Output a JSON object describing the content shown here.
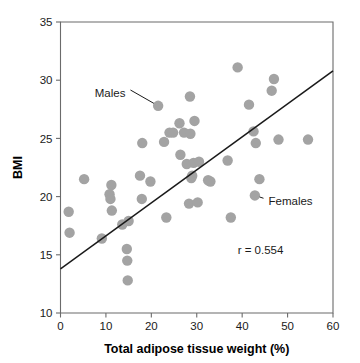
{
  "chart_data": {
    "type": "scatter",
    "title": "",
    "xlabel": "Total adipose tissue weight (%)",
    "ylabel": "BMI",
    "xlim": [
      0,
      60
    ],
    "ylim": [
      10,
      35
    ],
    "xticks": [
      0,
      10,
      20,
      30,
      40,
      50,
      60
    ],
    "yticks": [
      10,
      15,
      20,
      25,
      30,
      35
    ],
    "xticklabels": [
      "0",
      "10",
      "20",
      "30",
      "40",
      "50",
      "60"
    ],
    "yticklabels": [
      "10",
      "15",
      "20",
      "25",
      "30",
      "35"
    ],
    "grid": false,
    "legend": "none",
    "point_color": "#a3a3a3",
    "line_color": "#1a1a1a",
    "marker_size": 5.2,
    "series": [
      {
        "name": "Subjects",
        "points": [
          [
            1.8,
            18.7
          ],
          [
            2.0,
            16.9
          ],
          [
            5.2,
            21.5
          ],
          [
            9.1,
            16.4
          ],
          [
            10.8,
            20.2
          ],
          [
            11.0,
            19.8
          ],
          [
            11.2,
            21.0
          ],
          [
            11.3,
            18.8
          ],
          [
            13.6,
            17.6
          ],
          [
            14.6,
            15.5
          ],
          [
            14.7,
            14.5
          ],
          [
            14.8,
            12.8
          ],
          [
            15.0,
            17.9
          ],
          [
            17.5,
            21.8
          ],
          [
            17.9,
            19.8
          ],
          [
            18.0,
            24.6
          ],
          [
            19.8,
            21.3
          ],
          [
            21.5,
            27.8
          ],
          [
            22.8,
            24.7
          ],
          [
            23.3,
            18.2
          ],
          [
            24.0,
            25.5
          ],
          [
            24.8,
            25.5
          ],
          [
            26.2,
            26.3
          ],
          [
            26.4,
            23.6
          ],
          [
            27.2,
            25.5
          ],
          [
            27.8,
            22.8
          ],
          [
            28.3,
            19.4
          ],
          [
            28.5,
            28.6
          ],
          [
            28.6,
            25.4
          ],
          [
            28.8,
            21.6
          ],
          [
            29.0,
            21.8
          ],
          [
            29.3,
            22.9
          ],
          [
            29.5,
            26.5
          ],
          [
            30.2,
            19.5
          ],
          [
            30.5,
            23.0
          ],
          [
            32.5,
            21.4
          ],
          [
            33.0,
            21.3
          ],
          [
            36.8,
            23.1
          ],
          [
            37.5,
            18.2
          ],
          [
            39.0,
            31.1
          ],
          [
            41.5,
            27.9
          ],
          [
            42.5,
            25.6
          ],
          [
            42.8,
            20.1
          ],
          [
            43.0,
            24.6
          ],
          [
            43.8,
            21.5
          ],
          [
            46.5,
            29.1
          ],
          [
            47.0,
            30.1
          ],
          [
            48.0,
            24.9
          ],
          [
            54.5,
            24.9
          ]
        ]
      }
    ],
    "regression_line": {
      "x0": 0,
      "y0": 13.8,
      "x1": 60,
      "y1": 30.8
    },
    "annotations": [
      {
        "id": "males",
        "text": "Males",
        "text_x": 14.3,
        "text_y": 28.9,
        "target_x": 21.5,
        "target_y": 27.8
      },
      {
        "id": "females",
        "text": "Females",
        "text_x": 45.8,
        "text_y": 19.6,
        "target_x": 42.8,
        "target_y": 20.1
      },
      {
        "id": "correlation",
        "text": "r = 0.554",
        "text_x": 39.0,
        "text_y": 15.4,
        "target_x": null,
        "target_y": null
      }
    ]
  }
}
